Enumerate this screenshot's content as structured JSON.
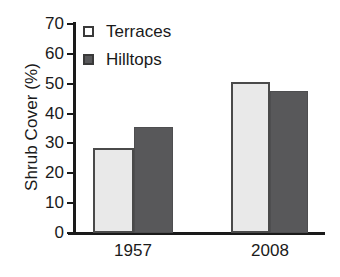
{
  "chart_data": {
    "type": "bar",
    "title": "",
    "xlabel": "",
    "ylabel": "Shrub Cover (%)",
    "categories": [
      "1957",
      "2008"
    ],
    "series": [
      {
        "name": "Terraces",
        "values": [
          28.5,
          50.5
        ],
        "color": "#e9e9e9"
      },
      {
        "name": "Hilltops",
        "values": [
          35.5,
          47.5
        ],
        "color": "#58585a"
      }
    ],
    "ylim": [
      0,
      70
    ],
    "ytick_labels": [
      "70",
      "60",
      "50",
      "40",
      "30",
      "20",
      "10",
      "0"
    ],
    "ytick_values": [
      70,
      60,
      50,
      40,
      30,
      20,
      10,
      0
    ],
    "grid": false,
    "legend_position": "top-left"
  },
  "axes": {
    "y_title": "Shrub Cover (%)",
    "y_ticks": [
      {
        "label": "70",
        "value": 70
      },
      {
        "label": "60",
        "value": 60
      },
      {
        "label": "50",
        "value": 50
      },
      {
        "label": "40",
        "value": 40
      },
      {
        "label": "30",
        "value": 30
      },
      {
        "label": "20",
        "value": 20
      },
      {
        "label": "10",
        "value": 10
      },
      {
        "label": "0",
        "value": 0
      }
    ],
    "x_ticks": [
      {
        "label": "1957"
      },
      {
        "label": "2008"
      }
    ]
  },
  "legend": {
    "items": [
      {
        "label": "Terraces",
        "swatch": "light-square-swatch"
      },
      {
        "label": "Hilltops",
        "swatch": "dark-square-swatch"
      }
    ]
  },
  "bars": [
    {
      "name": "bar-1957-terraces",
      "group": "1957",
      "series": "Terraces",
      "value": 28.5,
      "style": "light"
    },
    {
      "name": "bar-1957-hilltops",
      "group": "1957",
      "series": "Hilltops",
      "value": 35.5,
      "style": "dark"
    },
    {
      "name": "bar-2008-terraces",
      "group": "2008",
      "series": "Terraces",
      "value": 50.5,
      "style": "light"
    },
    {
      "name": "bar-2008-hilltops",
      "group": "2008",
      "series": "Hilltops",
      "value": 47.5,
      "style": "dark"
    }
  ]
}
